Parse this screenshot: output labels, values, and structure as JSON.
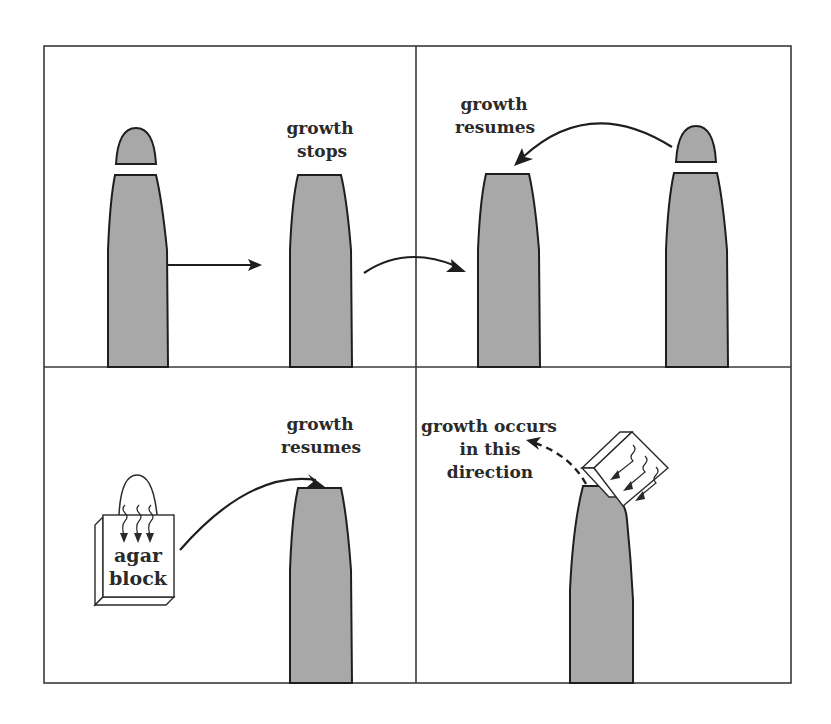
{
  "figure": {
    "colors": {
      "shoot_fill": "#a8a8a8",
      "outline": "#1e1e1e",
      "frame": "#3a3a3a",
      "background": "#ffffff"
    },
    "panels": [
      {
        "id": "top-left",
        "labels": {
          "line1": "growth",
          "line2": "stops"
        },
        "elements": [
          "shoot-with-detached-tip",
          "arrow-right",
          "decapitated-shoot"
        ]
      },
      {
        "id": "top-right",
        "labels": {
          "line1": "growth",
          "line2": "resumes"
        },
        "elements": [
          "decapitated-shoot",
          "curved-arrow-left",
          "shoot-with-detached-tip"
        ]
      },
      {
        "id": "bottom-left",
        "labels": {
          "line1": "growth",
          "line2": "resumes"
        },
        "block_label": {
          "line1": "agar",
          "line2": "block"
        },
        "elements": [
          "tip-on-agar-block",
          "curved-arrow-right",
          "shoot-with-agar-block"
        ]
      },
      {
        "id": "bottom-right",
        "labels": {
          "line1": "growth occurs",
          "line2": "in this",
          "line3": "direction"
        },
        "elements": [
          "shoot-with-offset-agar-block",
          "dashed-arrow"
        ]
      }
    ]
  }
}
